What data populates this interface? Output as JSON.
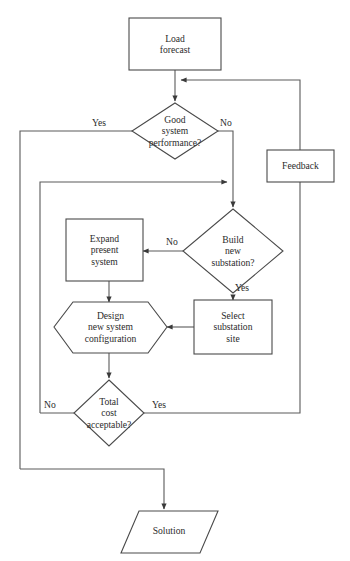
{
  "diagram": {
    "colors": {
      "stroke": "#4a4a4a",
      "connector": "#5a5a5a",
      "text": "#2b2b2b",
      "background": "#ffffff"
    },
    "nodes": [
      {
        "id": "load-forecast",
        "shape": "rectangle",
        "label": "Load\nforecast"
      },
      {
        "id": "good-system-performance",
        "shape": "diamond",
        "label": "Good\nsystem\nperformance?"
      },
      {
        "id": "feedback",
        "shape": "rectangle",
        "label": "Feedback"
      },
      {
        "id": "build-new-substation",
        "shape": "diamond",
        "label": "Build\nnew\nsubstation?"
      },
      {
        "id": "expand-present-system",
        "shape": "rectangle",
        "label": "Expand\npresent\nsystem"
      },
      {
        "id": "design-new-system-configuration",
        "shape": "hexagon",
        "label": "Design\nnew system\nconfiguration"
      },
      {
        "id": "select-substation-site",
        "shape": "rectangle",
        "label": "Select\nsubstation\nsite"
      },
      {
        "id": "total-cost-acceptable",
        "shape": "diamond",
        "label": "Total\ncost\nacceptable?"
      },
      {
        "id": "solution",
        "shape": "parallelogram",
        "label": "Solution"
      }
    ],
    "edge_labels": [
      {
        "id": "good-performance-yes",
        "text": "Yes"
      },
      {
        "id": "good-performance-no",
        "text": "No"
      },
      {
        "id": "build-substation-no",
        "text": "No"
      },
      {
        "id": "build-substation-yes",
        "text": "Yes"
      },
      {
        "id": "total-cost-no",
        "text": "No"
      },
      {
        "id": "total-cost-yes",
        "text": "Yes"
      }
    ]
  }
}
